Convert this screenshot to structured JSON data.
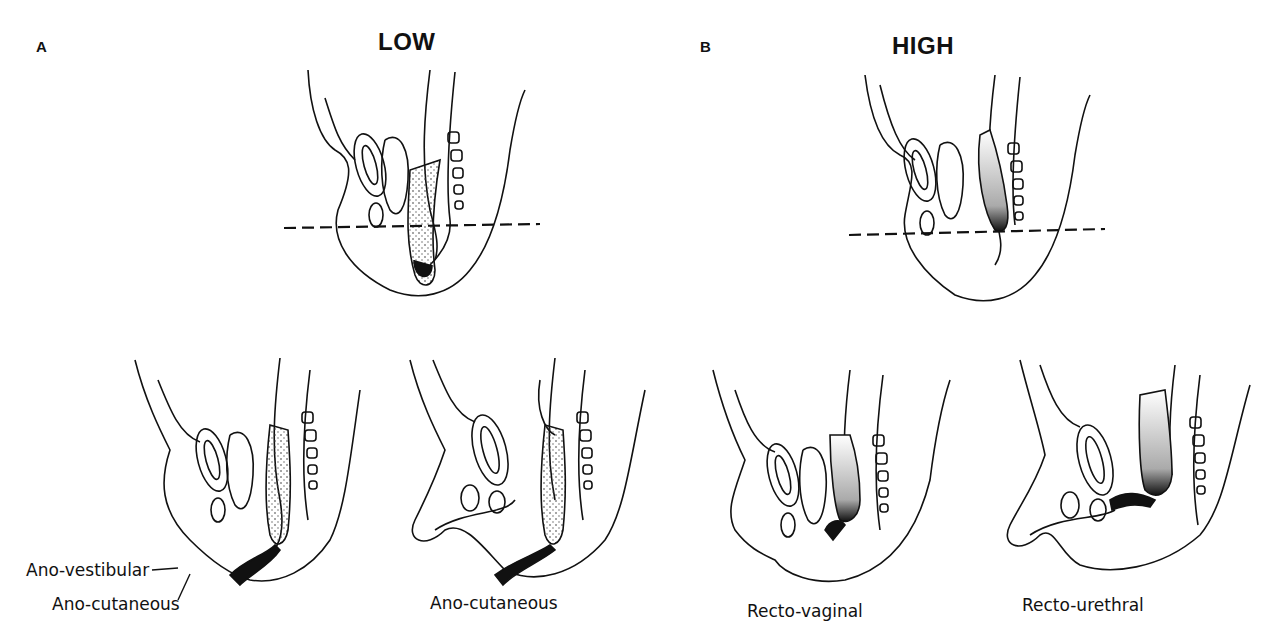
{
  "panels": [
    {
      "letter": "A",
      "title": "LOW",
      "figures": [
        {
          "id": "low-reference",
          "caption": ""
        },
        {
          "id": "low-female",
          "labels": [
            "Ano-vestibular",
            "Ano-cutaneous"
          ]
        },
        {
          "id": "low-male",
          "labels": [
            "Ano-cutaneous"
          ]
        }
      ]
    },
    {
      "letter": "B",
      "title": "HIGH",
      "figures": [
        {
          "id": "high-reference",
          "caption": ""
        },
        {
          "id": "high-female",
          "labels": [
            "Recto-vaginal"
          ]
        },
        {
          "id": "high-male",
          "labels": [
            "Recto-urethral"
          ]
        }
      ]
    }
  ],
  "colors": {
    "ink": "#111111",
    "background": "#ffffff"
  }
}
